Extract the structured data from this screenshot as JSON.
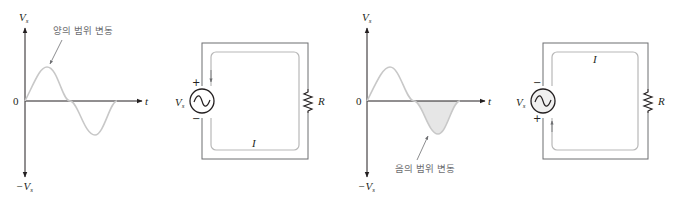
{
  "colors": {
    "axis": "#231f20",
    "wave": "#c8c8c8",
    "wire": "#6d6e71",
    "current_path": "#b8b8b8",
    "neg_fill": "#e6e6e6",
    "label_gray": "#6d6e71"
  },
  "left_graph": {
    "y_top_label": "V",
    "y_top_sub": "s",
    "y_bottom_label": "−V",
    "y_bottom_sub": "s",
    "origin_label": "0",
    "x_axis_label": "t",
    "annotation": "양의 범위 변동"
  },
  "left_circuit": {
    "source_label": "V",
    "source_sub": "s",
    "plus": "+",
    "minus": "−",
    "resistor_label": "R",
    "current_label": "I",
    "source_icon": "ac-source-icon"
  },
  "right_graph": {
    "y_top_label": "V",
    "y_top_sub": "s",
    "y_bottom_label": "−V",
    "y_bottom_sub": "s",
    "origin_label": "0",
    "x_axis_label": "t",
    "annotation": "음의 범위 변동"
  },
  "right_circuit": {
    "source_label": "V",
    "source_sub": "s",
    "plus": "+",
    "minus": "−",
    "resistor_label": "R",
    "current_label": "I",
    "source_icon": "ac-source-icon"
  }
}
